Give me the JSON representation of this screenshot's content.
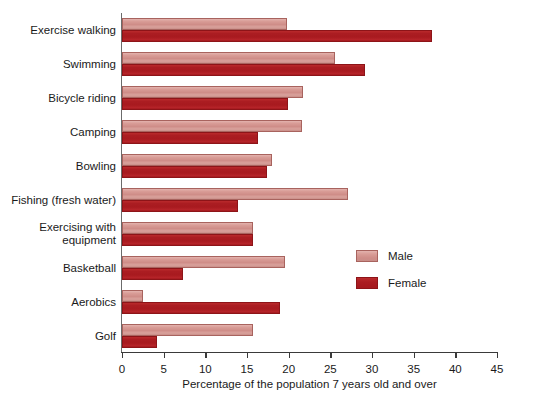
{
  "chart_data": {
    "type": "bar",
    "orientation": "horizontal",
    "title": "",
    "xlabel": "Percentage of the population 7 years old and over",
    "ylabel": "",
    "xlim": [
      0,
      45
    ],
    "xticks": [
      0,
      5,
      10,
      15,
      20,
      25,
      30,
      35,
      40,
      45
    ],
    "grid": false,
    "legend_position": "middle-right",
    "categories": [
      "Exercise walking",
      "Swimming",
      "Bicycle riding",
      "Camping",
      "Bowling",
      "Fishing (fresh water)",
      "Exercising with\nequipment",
      "Basketball",
      "Aerobics",
      "Golf"
    ],
    "series": [
      {
        "name": "Male",
        "color": "#D4908C",
        "values": [
          19.8,
          25.5,
          21.7,
          21.6,
          18.0,
          27.1,
          15.7,
          19.6,
          2.5,
          15.7
        ]
      },
      {
        "name": "Female",
        "color": "#AB1D22",
        "values": [
          37.2,
          29.2,
          19.9,
          16.3,
          17.4,
          13.9,
          15.7,
          7.3,
          19.0,
          4.2
        ]
      }
    ]
  },
  "legend": {
    "items": [
      {
        "label": "Male"
      },
      {
        "label": "Female"
      }
    ]
  }
}
